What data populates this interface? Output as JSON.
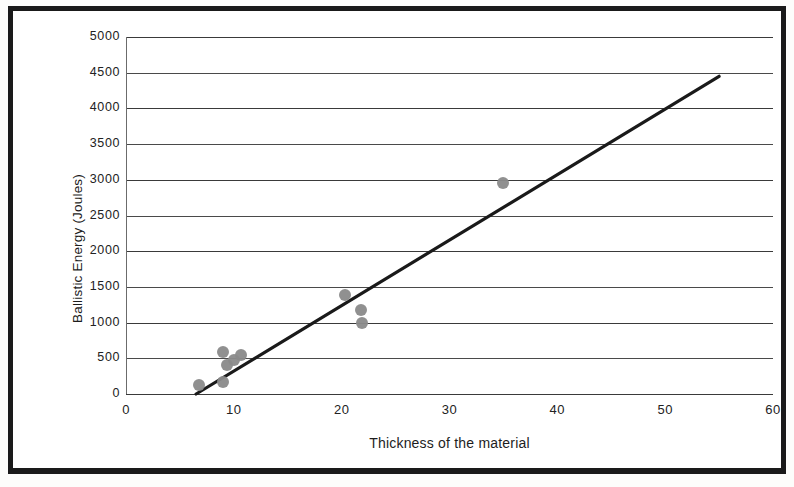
{
  "chart_data": {
    "type": "scatter",
    "title": "",
    "xlabel": "Thickness of the material",
    "ylabel": "Ballistic Energy (Joules)",
    "xlim": [
      0,
      60
    ],
    "ylim": [
      0,
      5000
    ],
    "xticks": [
      0,
      10,
      20,
      30,
      40,
      50,
      60
    ],
    "yticks": [
      0,
      500,
      1000,
      1500,
      2000,
      2500,
      3000,
      3500,
      4000,
      4500,
      5000
    ],
    "xtick_labels": [
      "0",
      "10",
      "20",
      "30",
      "40",
      "50",
      "60"
    ],
    "ytick_labels": [
      "0",
      "500",
      "1000",
      "1500",
      "2000",
      "2500",
      "3000",
      "3500",
      "4000",
      "4500",
      "5000"
    ],
    "grid": "horizontal",
    "legend": "none",
    "marker_color": "#8a8a8a",
    "trendline_color": "#1a1a1a",
    "series": [
      {
        "name": "Ballistic energy vs thickness",
        "points": [
          {
            "x": 6.8,
            "y": 130
          },
          {
            "x": 9.0,
            "y": 175
          },
          {
            "x": 9.0,
            "y": 590
          },
          {
            "x": 9.4,
            "y": 400
          },
          {
            "x": 10.0,
            "y": 470
          },
          {
            "x": 10.7,
            "y": 540
          },
          {
            "x": 20.3,
            "y": 1380
          },
          {
            "x": 21.8,
            "y": 1170
          },
          {
            "x": 21.9,
            "y": 1000
          },
          {
            "x": 35.0,
            "y": 2960
          }
        ]
      }
    ],
    "trendline": {
      "type": "linear",
      "x_start": 6.5,
      "y_start": 0,
      "x_end": 55.0,
      "y_end": 4450
    }
  }
}
